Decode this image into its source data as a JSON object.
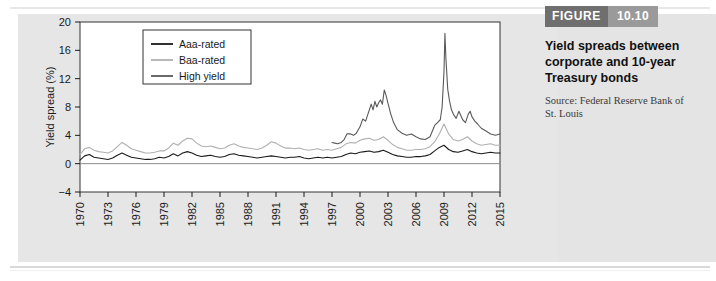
{
  "figure": {
    "label": "FIGURE",
    "number": "10.10",
    "title": "Yield spreads between corporate and 10-year Treasury bonds",
    "source": "Source: Federal Reserve Bank of St. Louis"
  },
  "colors": {
    "aaa": "#1a1a1a",
    "baa": "#b0b0b0",
    "high_yield": "#5a5a5a",
    "figure_label_bg": "#6f6f6f",
    "figure_number_bg": "#9a9a9a",
    "panel_bg": "#e4e4e4",
    "plot_bg": "#ffffff",
    "axis": "#1a1a1a"
  },
  "chart_data": {
    "type": "line",
    "title": "",
    "xlabel": "",
    "ylabel": "Yield spread (%)",
    "xlim": [
      1970,
      2015
    ],
    "ylim": [
      -4,
      20
    ],
    "yticks": [
      -4,
      0,
      4,
      8,
      12,
      16,
      20
    ],
    "xticks": [
      1970,
      1973,
      1976,
      1979,
      1982,
      1985,
      1988,
      1991,
      1994,
      1997,
      2000,
      2003,
      2006,
      2009,
      2012,
      2015
    ],
    "grid": false,
    "legend_position": "top-left-inside",
    "series": [
      {
        "name": "Aaa-rated",
        "color": "#1a1a1a",
        "x": [
          1970.0,
          1970.5,
          1971.0,
          1971.5,
          1972.0,
          1972.5,
          1973.0,
          1973.5,
          1974.0,
          1974.5,
          1975.0,
          1975.5,
          1976.0,
          1976.5,
          1977.0,
          1977.5,
          1978.0,
          1978.5,
          1979.0,
          1979.5,
          1980.0,
          1980.5,
          1981.0,
          1981.5,
          1982.0,
          1982.5,
          1983.0,
          1983.5,
          1984.0,
          1984.5,
          1985.0,
          1985.5,
          1986.0,
          1986.5,
          1987.0,
          1987.5,
          1988.0,
          1988.5,
          1989.0,
          1989.5,
          1990.0,
          1990.5,
          1991.0,
          1991.5,
          1992.0,
          1992.5,
          1993.0,
          1993.5,
          1994.0,
          1994.5,
          1995.0,
          1995.5,
          1996.0,
          1996.5,
          1997.0,
          1997.5,
          1998.0,
          1998.5,
          1999.0,
          1999.5,
          2000.0,
          2000.5,
          2001.0,
          2001.5,
          2002.0,
          2002.5,
          2003.0,
          2003.5,
          2004.0,
          2004.5,
          2005.0,
          2005.5,
          2006.0,
          2006.5,
          2007.0,
          2007.5,
          2008.0,
          2008.5,
          2009.0,
          2009.5,
          2010.0,
          2010.5,
          2011.0,
          2011.5,
          2012.0,
          2012.5,
          2013.0,
          2013.5,
          2014.0,
          2014.5,
          2015.0
        ],
        "values": [
          0.5,
          1.1,
          1.3,
          0.9,
          0.8,
          0.7,
          0.6,
          0.8,
          1.2,
          1.5,
          1.2,
          0.9,
          0.8,
          0.7,
          0.6,
          0.6,
          0.7,
          0.9,
          0.8,
          1.0,
          1.4,
          1.1,
          1.5,
          1.7,
          1.5,
          1.2,
          1.0,
          1.1,
          1.2,
          1.0,
          0.9,
          1.0,
          1.3,
          1.4,
          1.2,
          1.1,
          1.0,
          0.9,
          0.8,
          0.9,
          1.0,
          1.1,
          1.0,
          0.9,
          0.8,
          0.9,
          0.9,
          1.0,
          0.8,
          0.7,
          0.8,
          0.9,
          0.8,
          0.9,
          0.8,
          0.9,
          1.0,
          1.3,
          1.5,
          1.4,
          1.6,
          1.7,
          1.8,
          1.6,
          1.7,
          1.9,
          1.6,
          1.3,
          1.1,
          1.0,
          0.9,
          0.9,
          1.0,
          1.0,
          1.1,
          1.3,
          1.8,
          2.3,
          2.6,
          2.0,
          1.7,
          1.6,
          1.8,
          2.0,
          1.7,
          1.5,
          1.4,
          1.5,
          1.6,
          1.5,
          1.5
        ]
      },
      {
        "name": "Baa-rated",
        "color": "#b0b0b0",
        "x": [
          1970.0,
          1970.5,
          1971.0,
          1971.5,
          1972.0,
          1972.5,
          1973.0,
          1973.5,
          1974.0,
          1974.5,
          1975.0,
          1975.5,
          1976.0,
          1976.5,
          1977.0,
          1977.5,
          1978.0,
          1978.5,
          1979.0,
          1979.5,
          1980.0,
          1980.5,
          1981.0,
          1981.5,
          1982.0,
          1982.5,
          1983.0,
          1983.5,
          1984.0,
          1984.5,
          1985.0,
          1985.5,
          1986.0,
          1986.5,
          1987.0,
          1987.5,
          1988.0,
          1988.5,
          1989.0,
          1989.5,
          1990.0,
          1990.5,
          1991.0,
          1991.5,
          1992.0,
          1992.5,
          1993.0,
          1993.5,
          1994.0,
          1994.5,
          1995.0,
          1995.5,
          1996.0,
          1996.5,
          1997.0,
          1997.5,
          1998.0,
          1998.5,
          1999.0,
          1999.5,
          2000.0,
          2000.5,
          2001.0,
          2001.5,
          2002.0,
          2002.5,
          2003.0,
          2003.5,
          2004.0,
          2004.5,
          2005.0,
          2005.5,
          2006.0,
          2006.5,
          2007.0,
          2007.5,
          2008.0,
          2008.5,
          2009.0,
          2009.5,
          2010.0,
          2010.5,
          2011.0,
          2011.5,
          2012.0,
          2012.5,
          2013.0,
          2013.5,
          2014.0,
          2014.5,
          2015.0
        ],
        "values": [
          1.3,
          2.1,
          2.3,
          1.9,
          1.7,
          1.6,
          1.5,
          1.8,
          2.4,
          3.0,
          2.6,
          2.1,
          1.9,
          1.7,
          1.5,
          1.5,
          1.6,
          1.8,
          1.8,
          2.2,
          2.9,
          2.6,
          3.2,
          3.6,
          3.5,
          2.9,
          2.5,
          2.4,
          2.5,
          2.3,
          2.1,
          2.2,
          2.6,
          2.8,
          2.5,
          2.3,
          2.2,
          2.1,
          2.0,
          2.2,
          2.6,
          3.1,
          2.9,
          2.5,
          2.2,
          2.2,
          2.1,
          2.2,
          2.0,
          1.9,
          2.0,
          2.1,
          1.9,
          2.0,
          1.9,
          2.1,
          2.3,
          2.8,
          3.0,
          2.9,
          3.3,
          3.5,
          3.6,
          3.3,
          3.4,
          3.8,
          3.3,
          2.7,
          2.3,
          2.1,
          1.9,
          1.9,
          2.0,
          2.0,
          2.1,
          2.4,
          3.1,
          4.2,
          5.6,
          4.2,
          3.4,
          3.2,
          3.4,
          3.8,
          3.2,
          2.8,
          2.6,
          2.7,
          2.8,
          2.6,
          2.6
        ]
      },
      {
        "name": "High yield",
        "color": "#5a5a5a",
        "x": [
          1997.0,
          1997.3,
          1997.6,
          1998.0,
          1998.3,
          1998.6,
          1999.0,
          1999.3,
          1999.6,
          2000.0,
          2000.3,
          2000.6,
          2001.0,
          2001.2,
          2001.4,
          2001.6,
          2001.8,
          2002.0,
          2002.2,
          2002.4,
          2002.6,
          2002.8,
          2003.0,
          2003.3,
          2003.6,
          2004.0,
          2004.5,
          2005.0,
          2005.5,
          2006.0,
          2006.5,
          2007.0,
          2007.5,
          2008.0,
          2008.3,
          2008.6,
          2008.8,
          2009.0,
          2009.1,
          2009.2,
          2009.4,
          2009.6,
          2009.8,
          2010.0,
          2010.3,
          2010.6,
          2011.0,
          2011.3,
          2011.6,
          2011.8,
          2012.0,
          2012.3,
          2012.6,
          2013.0,
          2013.5,
          2014.0,
          2014.5,
          2015.0
        ],
        "values": [
          3.0,
          2.9,
          2.8,
          3.0,
          3.4,
          4.2,
          4.2,
          4.0,
          4.3,
          5.2,
          6.3,
          6.0,
          7.6,
          8.4,
          7.6,
          8.8,
          8.0,
          8.6,
          9.0,
          8.4,
          10.4,
          9.6,
          8.5,
          7.0,
          5.8,
          4.8,
          4.3,
          4.0,
          4.2,
          3.8,
          3.5,
          3.4,
          3.8,
          5.4,
          5.8,
          6.2,
          8.0,
          13.0,
          18.4,
          15.0,
          10.5,
          8.8,
          7.6,
          7.0,
          6.4,
          7.4,
          6.2,
          5.8,
          7.0,
          7.4,
          6.6,
          6.0,
          5.6,
          5.0,
          4.6,
          4.2,
          4.0,
          4.2
        ]
      }
    ]
  }
}
